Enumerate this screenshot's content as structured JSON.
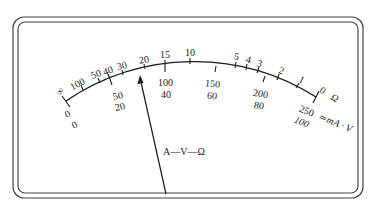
{
  "meter": {
    "ohm_scale": {
      "unit": "Ω",
      "labels": [
        "∞",
        "100",
        "50",
        "40",
        "30",
        "20",
        "15",
        "10",
        "5",
        "4",
        "3",
        "2",
        "1",
        "0"
      ]
    },
    "dc_scale_250": {
      "labels": [
        "0",
        "50",
        "100",
        "150",
        "200",
        "250"
      ]
    },
    "dc_scale_100": {
      "labels": [
        "0",
        "20",
        "40",
        "60",
        "80",
        "100"
      ]
    },
    "dc_unit": "≃mA · V",
    "pointer_label": "A—V—Ω"
  }
}
